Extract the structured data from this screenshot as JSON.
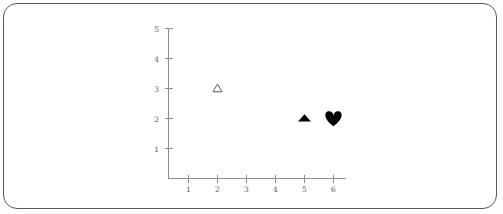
{
  "figure": {
    "frame_color": "#555a5e",
    "background_color": "#ffffff",
    "axis_color": "#8d8d8d",
    "label_color": "#5a5a5a",
    "marker_color": "#000000"
  },
  "chart_data": {
    "type": "scatter",
    "title": "",
    "subtitle": "",
    "xlabel": "",
    "ylabel": "",
    "xlim": [
      0,
      6.5
    ],
    "ylim": [
      0,
      5.3
    ],
    "xticks": [
      1,
      2,
      3,
      4,
      5,
      6
    ],
    "yticks": [
      1,
      2,
      3,
      4,
      5
    ],
    "xtick_labels": [
      "1",
      "2",
      "3",
      "4",
      "5",
      "6"
    ],
    "ytick_labels": [
      "1",
      "2",
      "3",
      "4",
      "5"
    ],
    "grid": false,
    "legend": null,
    "spines": [
      "left",
      "bottom"
    ],
    "points": [
      {
        "label": "open-triangle-marker",
        "marker": "triangle-up-open",
        "x": 2,
        "y": 3,
        "filled": false,
        "size_px": 9,
        "color": "#4a4a4a"
      },
      {
        "label": "filled-triangle-marker",
        "marker": "triangle-up-filled",
        "x": 5,
        "y": 2,
        "filled": true,
        "size_px": 13,
        "color": "#000000"
      },
      {
        "label": "filled-heart-marker",
        "marker": "heart-filled",
        "x": 6,
        "y": 2,
        "filled": true,
        "size_px": 17,
        "color": "#000000"
      }
    ]
  }
}
